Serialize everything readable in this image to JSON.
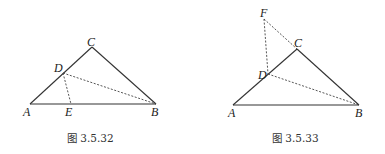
{
  "figures": [
    {
      "id": "fig1",
      "caption": "图 3.5.32",
      "points": {
        "A": {
          "label": "A",
          "x": 30,
          "y": 104
        },
        "B": {
          "label": "B",
          "x": 156,
          "y": 104
        },
        "C": {
          "label": "C",
          "x": 92,
          "y": 47
        },
        "D": {
          "label": "D",
          "x": 63,
          "y": 73
        },
        "E": {
          "label": "E",
          "x": 71,
          "y": 104
        }
      },
      "solid_segments": [
        "AB",
        "AC",
        "CB"
      ],
      "dashed_segments": [
        "DE",
        "DB"
      ]
    },
    {
      "id": "fig2",
      "caption": "图 3.5.33",
      "points": {
        "A": {
          "label": "A",
          "x": 233,
          "y": 105
        },
        "B": {
          "label": "B",
          "x": 359,
          "y": 105
        },
        "C": {
          "label": "C",
          "x": 297,
          "y": 49
        },
        "D": {
          "label": "D",
          "x": 268,
          "y": 74
        },
        "F": {
          "label": "F",
          "x": 264,
          "y": 19
        }
      },
      "solid_segments": [
        "AB",
        "AC",
        "CB"
      ],
      "dashed_segments": [
        "FD",
        "FC",
        "DB"
      ]
    }
  ]
}
